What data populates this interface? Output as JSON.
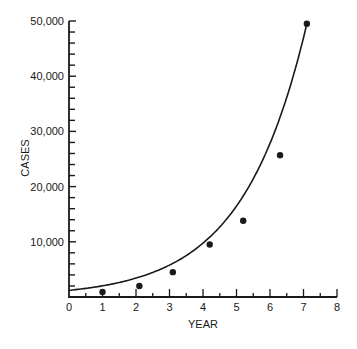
{
  "chart_data": {
    "type": "scatter",
    "title": "",
    "xlabel": "YEAR",
    "ylabel": "CASES",
    "xlim": [
      0,
      8
    ],
    "ylim": [
      0,
      50000
    ],
    "x_ticks": [
      "0",
      "1",
      "2",
      "3",
      "4",
      "5",
      "6",
      "7",
      "8"
    ],
    "y_ticks": [
      "10,000",
      "20,000",
      "30,000",
      "40,000",
      "50,000"
    ],
    "grid": false,
    "legend": null,
    "series": [
      {
        "name": "observed cases",
        "style": "points",
        "x": [
          1.0,
          2.1,
          3.1,
          4.2,
          5.2,
          6.3,
          7.1
        ],
        "y": [
          900,
          2000,
          4500,
          9500,
          13800,
          25700,
          49500
        ]
      },
      {
        "name": "exponential fit",
        "style": "line",
        "x": [
          0,
          1,
          2,
          3,
          4,
          5,
          6,
          7,
          7.1
        ],
        "y": [
          1200,
          1900,
          3000,
          5000,
          8200,
          13500,
          22500,
          45000,
          49500
        ]
      }
    ]
  },
  "axes": {
    "x_title": "YEAR",
    "y_title": "CASES",
    "x_labels": [
      "0",
      "1",
      "2",
      "3",
      "4",
      "5",
      "6",
      "7",
      "8"
    ],
    "y_labels": [
      "10,000",
      "20,000",
      "30,000",
      "40,000",
      "50,000"
    ]
  }
}
